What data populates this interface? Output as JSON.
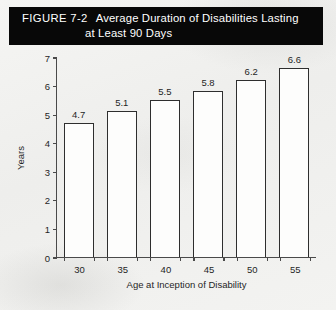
{
  "figure": {
    "number": "FIGURE 7-2",
    "title_line_1": "Average Duration of Disabilities Lasting",
    "title_line_2": "at Least 90 Days",
    "banner_color": "#080808",
    "banner_text_color": "#ffffff"
  },
  "chart_data": {
    "type": "bar",
    "title": "Average Duration of Disabilities Lasting at Least 90 Days",
    "categories": [
      "30",
      "35",
      "40",
      "45",
      "50",
      "55"
    ],
    "values": [
      4.7,
      5.1,
      5.5,
      5.8,
      6.2,
      6.6
    ],
    "value_labels": [
      "4.7",
      "5.1",
      "5.5",
      "5.8",
      "6.2",
      "6.6"
    ],
    "xlabel": "Age at Inception of Disability",
    "ylabel": "Years",
    "ylim": [
      0,
      7
    ],
    "yticks": [
      0,
      1,
      2,
      3,
      4,
      5,
      6,
      7
    ],
    "ytick_labels": [
      "0",
      "1",
      "2",
      "3",
      "4",
      "5",
      "6",
      "7"
    ],
    "grid": false,
    "legend": false,
    "bar_fill_color": "#fdfdfc",
    "bar_edge_color": "#2e2e2e",
    "axis_color": "#4a4a4a"
  }
}
